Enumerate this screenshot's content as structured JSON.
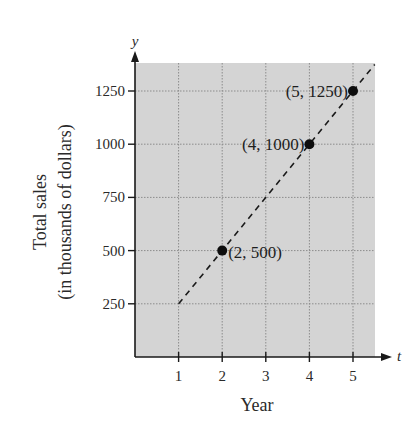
{
  "chart_data": {
    "type": "scatter",
    "title": "",
    "xlabel": "Year",
    "ylabel": "Total sales",
    "ylabel_sub": "(in thousands of dollars)",
    "x_axis_var": "t",
    "y_axis_var": "y",
    "x_ticks": [
      1,
      2,
      3,
      4,
      5
    ],
    "x_tick_labels": [
      "1",
      "2",
      "3",
      "4",
      "5"
    ],
    "y_ticks": [
      250,
      500,
      750,
      1000,
      1250
    ],
    "y_tick_labels": [
      "250",
      "500",
      "750",
      "1000",
      "1250"
    ],
    "xlim": [
      0,
      5.5
    ],
    "ylim": [
      0,
      1375
    ],
    "grid": true,
    "legend": null,
    "series": [
      {
        "name": "data points",
        "type": "scatter",
        "points": [
          {
            "x": 2,
            "y": 500,
            "label": "(2, 500)"
          },
          {
            "x": 4,
            "y": 1000,
            "label": "(4, 1000)"
          },
          {
            "x": 5,
            "y": 1250,
            "label": "(5, 1250)"
          }
        ]
      },
      {
        "name": "trend line",
        "type": "line",
        "style": "dashed",
        "equation": "y = 250t",
        "x": [
          1,
          5.5
        ],
        "y": [
          250,
          1375
        ]
      }
    ],
    "colors": {
      "plot_background": "#d4d4d4",
      "grid": "#8c8c8c",
      "axis": "#1a1a1a",
      "points": "#0d0d0d",
      "line": "#1a1a1a"
    }
  }
}
